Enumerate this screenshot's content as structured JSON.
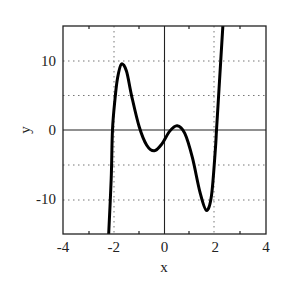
{
  "chart_data": {
    "type": "line",
    "title": "",
    "xlabel": "x",
    "ylabel": "y",
    "xlim": [
      -4,
      4
    ],
    "ylim": [
      -15,
      15
    ],
    "grid": "dotted",
    "legend": null,
    "x_ticks": [
      "-4",
      "-2",
      "0",
      "2",
      "4"
    ],
    "y_ticks": [
      "10",
      "0",
      "-10"
    ],
    "series": [
      {
        "name": "curve",
        "color": "#000000",
        "points": [
          [
            -2.2,
            -15
          ],
          [
            -2.1,
            -7
          ],
          [
            -2.05,
            0
          ],
          [
            -1.95,
            4.5
          ],
          [
            -1.85,
            7.5
          ],
          [
            -1.7,
            9.5
          ],
          [
            -1.5,
            8.5
          ],
          [
            -1.3,
            5
          ],
          [
            -1.0,
            0.5
          ],
          [
            -0.7,
            -2.2
          ],
          [
            -0.4,
            -3.0
          ],
          [
            -0.1,
            -2.0
          ],
          [
            0.2,
            -0.2
          ],
          [
            0.5,
            0.6
          ],
          [
            0.8,
            -0.5
          ],
          [
            1.1,
            -4.0
          ],
          [
            1.4,
            -9.0
          ],
          [
            1.65,
            -11.6
          ],
          [
            1.85,
            -9.5
          ],
          [
            2.0,
            -3.0
          ],
          [
            2.05,
            0
          ],
          [
            2.15,
            6
          ],
          [
            2.3,
            15
          ]
        ]
      }
    ]
  }
}
